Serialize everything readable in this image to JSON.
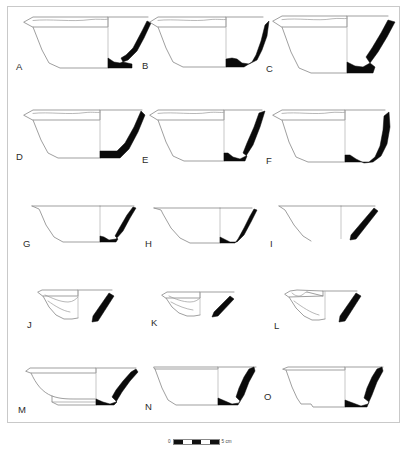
{
  "plate": {
    "type": "archaeological-pottery-profile-plate",
    "background_color": "#ffffff",
    "frame_color": "#c9c9c9",
    "outline_color": "#8e8e8e",
    "section_fill_color": "#0a0a0a",
    "rows": 5,
    "columns": 3,
    "figure_count": 15
  },
  "figures": [
    {
      "id": "A",
      "label": "A",
      "row": 1,
      "col": 1,
      "form": "flaring-sided bowl with everted rim and thick curved wall section"
    },
    {
      "id": "B",
      "label": "B",
      "row": 1,
      "col": 2,
      "form": "flaring-sided bowl with stepped basal angle"
    },
    {
      "id": "C",
      "label": "C",
      "row": 1,
      "col": 3,
      "form": "deep flaring bowl with angular thick wall section"
    },
    {
      "id": "D",
      "label": "D",
      "row": 2,
      "col": 1,
      "form": "flaring bowl with straight oblique wall section"
    },
    {
      "id": "E",
      "label": "E",
      "row": 2,
      "col": 2,
      "form": "flaring bowl with steep oblique wall section"
    },
    {
      "id": "F",
      "label": "F",
      "row": 2,
      "col": 3,
      "form": "deep bowl with rounded basal carination"
    },
    {
      "id": "G",
      "label": "G",
      "row": 3,
      "col": 1,
      "form": "small conical bowl, tapering wall section"
    },
    {
      "id": "H",
      "label": "H",
      "row": 3,
      "col": 2,
      "form": "small conical bowl, thin wall section"
    },
    {
      "id": "I",
      "label": "I",
      "row": 3,
      "col": 3,
      "form": "rim sherd, detached oblique wall fragment"
    },
    {
      "id": "J",
      "label": "J",
      "row": 4,
      "col": 1,
      "form": "shallow rim sherd with interior profile lines"
    },
    {
      "id": "K",
      "label": "K",
      "row": 4,
      "col": 2,
      "form": "shallow rim sherd, flattened interior"
    },
    {
      "id": "L",
      "label": "L",
      "row": 4,
      "col": 3,
      "form": "shallow rim sherd with carinated interior"
    },
    {
      "id": "M",
      "label": "M",
      "row": 5,
      "col": 1,
      "form": "carinated bowl on low ring base"
    },
    {
      "id": "N",
      "label": "N",
      "row": 5,
      "col": 2,
      "form": "deep conical bowl with flat base"
    },
    {
      "id": "O",
      "label": "O",
      "row": 5,
      "col": 3,
      "form": "deep flaring bowl with splayed base"
    }
  ],
  "scalebar": {
    "start_label": "0",
    "end_label": "5 cm",
    "segments": 5,
    "unit": "cm",
    "total_length": 5
  }
}
